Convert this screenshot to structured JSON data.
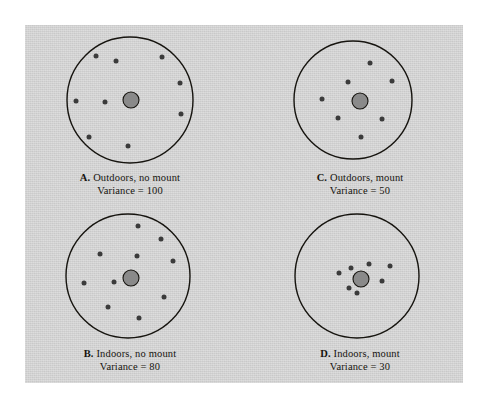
{
  "figure": {
    "background_color": "#ffffff",
    "plate_color": "#d2d2d2",
    "ink_color": "#16140f",
    "dot_color": "#3b3b3b",
    "center_fill_color": "#8a8a8a",
    "panels": [
      {
        "id": "A",
        "letter": "A.",
        "title": "Outdoors, no mount",
        "variance_label": "Variance = 100",
        "variance_value": 100,
        "circle": {
          "cx": 130,
          "cy": 100,
          "r": 63
        },
        "center_blob": {
          "cx": 131,
          "cy": 100,
          "r": 8
        },
        "shots": [
          {
            "x": 96,
            "y": 56
          },
          {
            "x": 116,
            "y": 61
          },
          {
            "x": 162,
            "y": 57
          },
          {
            "x": 180,
            "y": 83
          },
          {
            "x": 76,
            "y": 101
          },
          {
            "x": 105,
            "y": 102
          },
          {
            "x": 181,
            "y": 114
          },
          {
            "x": 89,
            "y": 137
          },
          {
            "x": 128,
            "y": 146
          }
        ]
      },
      {
        "id": "C",
        "letter": "C.",
        "title": "Outdoors, mount",
        "variance_label": "Variance = 50",
        "variance_value": 50,
        "circle": {
          "cx": 353,
          "cy": 100,
          "r": 59
        },
        "center_blob": {
          "cx": 360,
          "cy": 101,
          "r": 8
        },
        "shots": [
          {
            "x": 370,
            "y": 63
          },
          {
            "x": 348,
            "y": 82
          },
          {
            "x": 392,
            "y": 81
          },
          {
            "x": 322,
            "y": 99
          },
          {
            "x": 338,
            "y": 118
          },
          {
            "x": 382,
            "y": 119
          },
          {
            "x": 361,
            "y": 137
          }
        ]
      },
      {
        "id": "B",
        "letter": "B.",
        "title": "Indoors, no mount",
        "variance_label": "Variance = 80",
        "variance_value": 80,
        "circle": {
          "cx": 128,
          "cy": 276,
          "r": 62
        },
        "center_blob": {
          "cx": 131,
          "cy": 278,
          "r": 8
        },
        "shots": [
          {
            "x": 138,
            "y": 226
          },
          {
            "x": 161,
            "y": 239
          },
          {
            "x": 100,
            "y": 254
          },
          {
            "x": 137,
            "y": 256
          },
          {
            "x": 173,
            "y": 261
          },
          {
            "x": 84,
            "y": 283
          },
          {
            "x": 114,
            "y": 282
          },
          {
            "x": 164,
            "y": 297
          },
          {
            "x": 108,
            "y": 307
          },
          {
            "x": 139,
            "y": 318
          }
        ]
      },
      {
        "id": "D",
        "letter": "D.",
        "title": "Indoors, mount",
        "variance_label": "Variance = 30",
        "variance_value": 30,
        "circle": {
          "cx": 357,
          "cy": 276,
          "r": 62
        },
        "center_blob": {
          "cx": 361,
          "cy": 279,
          "r": 8
        },
        "shots": [
          {
            "x": 369,
            "y": 264
          },
          {
            "x": 390,
            "y": 266
          },
          {
            "x": 339,
            "y": 273
          },
          {
            "x": 351,
            "y": 268
          },
          {
            "x": 382,
            "y": 281
          },
          {
            "x": 349,
            "y": 288
          },
          {
            "x": 357,
            "y": 293
          }
        ]
      }
    ]
  },
  "chart_data": {
    "type": "scatter",
    "title": "",
    "xlabel": "",
    "ylabel": "",
    "legend_position": "none",
    "grid": false,
    "note": "Four target diagrams; each shows shot impacts (dots) scattered around a bullseye (filled center blob) inside a circular target outline.",
    "panels": [
      {
        "panel": "A",
        "caption": "A. Outdoors, no mount",
        "variance_label": "Variance = 100",
        "variance": 100,
        "shot_count": 9
      },
      {
        "panel": "B",
        "caption": "B. Indoors, no mount",
        "variance_label": "Variance = 80",
        "variance": 80,
        "shot_count": 10
      },
      {
        "panel": "C",
        "caption": "C. Outdoors, mount",
        "variance_label": "Variance = 50",
        "variance": 50,
        "shot_count": 7
      },
      {
        "panel": "D",
        "caption": "D. Indoors, mount",
        "variance_label": "Variance = 30",
        "variance": 30,
        "shot_count": 7
      }
    ],
    "categories": [
      "A. Outdoors, no mount",
      "B. Indoors, no mount",
      "C. Outdoors, mount",
      "D. Indoors, mount"
    ],
    "values": [
      100,
      80,
      50,
      30
    ],
    "series": [
      {
        "name": "Variance",
        "values": [
          100,
          80,
          50,
          30
        ]
      }
    ]
  }
}
